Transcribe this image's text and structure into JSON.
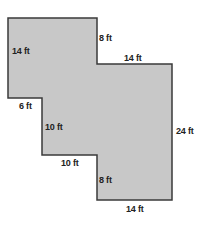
{
  "diagram": {
    "fill_color": "#c8c8c8",
    "stroke_color": "#3a3a3a",
    "vertices": [
      [
        8,
        18
      ],
      [
        97,
        18
      ],
      [
        97,
        64
      ],
      [
        172,
        64
      ],
      [
        172,
        200
      ],
      [
        97,
        200
      ],
      [
        97,
        155
      ],
      [
        42,
        155
      ],
      [
        42,
        98
      ],
      [
        8,
        98
      ]
    ],
    "labels": [
      {
        "text": "14 ft",
        "x": 12,
        "y": 46
      },
      {
        "text": "8 ft",
        "x": 99,
        "y": 33
      },
      {
        "text": "14 ft",
        "x": 124,
        "y": 53
      },
      {
        "text": "6 ft",
        "x": 19,
        "y": 101
      },
      {
        "text": "10 ft",
        "x": 45,
        "y": 122
      },
      {
        "text": "24 ft",
        "x": 176,
        "y": 126
      },
      {
        "text": "10 ft",
        "x": 61,
        "y": 158
      },
      {
        "text": "8 ft",
        "x": 99,
        "y": 175
      },
      {
        "text": "14 ft",
        "x": 126,
        "y": 204
      }
    ]
  }
}
